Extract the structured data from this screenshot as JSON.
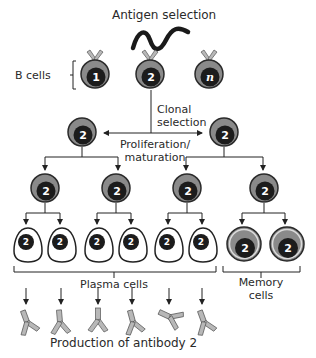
{
  "title": "Antigen selection",
  "labels": {
    "b_cells": "B cells",
    "clonal_selection_1": "Clonal",
    "clonal_selection_2": "selection",
    "proliferation_1": "Proliferation/",
    "proliferation_2": "maturation",
    "plasma_cells": "Plasma cells",
    "memory_cells_1": "Memory",
    "memory_cells_2": "cells",
    "production": "Production of antibody 2"
  },
  "b_cells": [
    {
      "id": "1",
      "selected": false
    },
    {
      "id": "2",
      "selected": true
    },
    {
      "id": "n",
      "selected": false
    }
  ],
  "clone_id": "2",
  "colors": {
    "cell_outer": "#8a8a8a",
    "cell_ring": "#3a3a3a",
    "nucleus": "#1c1c1c",
    "antibody": "#b8b8b8",
    "line": "#222222"
  }
}
